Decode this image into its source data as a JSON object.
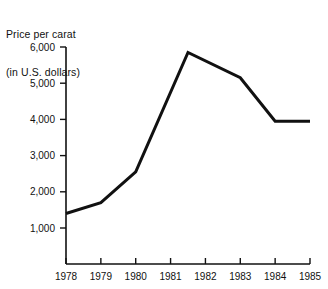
{
  "chart_data": {
    "type": "line",
    "title": "Price per carat\n(in U.S. dollars)",
    "title_line1": "Price per carat",
    "title_line2": "(in U.S. dollars)",
    "xlabel": "",
    "ylabel": "Price per carat (in U.S. dollars)",
    "grid": false,
    "legend": false,
    "xlim": [
      1978,
      1985
    ],
    "ylim": [
      0,
      6000
    ],
    "x_ticks": [
      1978,
      1979,
      1980,
      1981,
      1982,
      1983,
      1984,
      1985
    ],
    "x_tick_labels": [
      "1978",
      "1979",
      "1980",
      "1981",
      "1982",
      "1983",
      "1984",
      "1985"
    ],
    "y_ticks": [
      1000,
      2000,
      3000,
      4000,
      5000,
      6000
    ],
    "y_tick_labels": [
      "1,000",
      "2,000",
      "3,000",
      "4,000",
      "5,000",
      "6,000"
    ],
    "line_color": "#111111",
    "x": [
      1978,
      1979,
      1980,
      1981.5,
      1983,
      1984,
      1985
    ],
    "values": [
      1400,
      1700,
      2550,
      5850,
      5150,
      3950,
      3950
    ],
    "series": [
      {
        "name": "Price per carat",
        "x": [
          1978,
          1979,
          1980,
          1981.5,
          1983,
          1984,
          1985
        ],
        "values": [
          1400,
          1700,
          2550,
          5850,
          5150,
          3950,
          3950
        ]
      }
    ]
  },
  "figure": {
    "title_line1": "Price per carat",
    "title_line2": "(in U.S. dollars)"
  }
}
